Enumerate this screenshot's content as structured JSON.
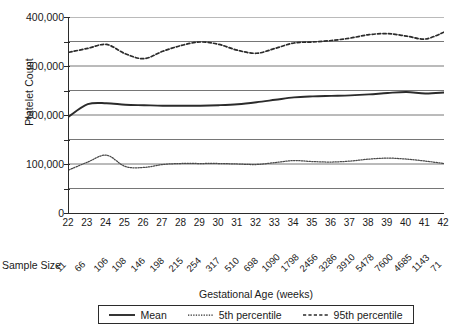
{
  "chart_data": {
    "type": "line",
    "title": "",
    "xlabel": "Gestational Age (weeks)",
    "ylabel": "Platelet Count",
    "xlim": [
      22,
      42
    ],
    "ylim": [
      0,
      400000
    ],
    "grid": true,
    "grid_interval": 50000,
    "legend_position": "bottom",
    "x": [
      22,
      23,
      24,
      25,
      26,
      27,
      28,
      29,
      30,
      31,
      32,
      33,
      34,
      35,
      36,
      37,
      38,
      39,
      40,
      41,
      42
    ],
    "xtick_labels": [
      "22",
      "23",
      "24",
      "25",
      "26",
      "27",
      "28",
      "29",
      "30",
      "31",
      "32",
      "33",
      "34",
      "35",
      "36",
      "37",
      "38",
      "39",
      "40",
      "41",
      "42"
    ],
    "ytick_labels": [
      "400,000",
      "300,000",
      "200,000",
      "100,000",
      "0"
    ],
    "ytick_values": [
      400000,
      300000,
      200000,
      100000,
      0
    ],
    "series": [
      {
        "name": "Mean",
        "style": "solid",
        "color": "#2b2b2b",
        "values": [
          197000,
          222000,
          224000,
          221000,
          220000,
          219000,
          219000,
          219000,
          220000,
          222000,
          226000,
          231000,
          236000,
          238000,
          239000,
          240000,
          242000,
          245000,
          247000,
          244000,
          246000
        ]
      },
      {
        "name": "5th percentile",
        "style": "dotted",
        "color": "#4a4a4a",
        "values": [
          88000,
          104000,
          118000,
          95000,
          93000,
          99000,
          101000,
          101000,
          101000,
          100000,
          99000,
          103000,
          107000,
          105000,
          104000,
          106000,
          110000,
          112000,
          110000,
          106000,
          101000
        ]
      },
      {
        "name": "95th percentile",
        "style": "dashed",
        "color": "#2b2b2b",
        "values": [
          328000,
          336000,
          344000,
          325000,
          315000,
          330000,
          342000,
          349000,
          344000,
          332000,
          326000,
          336000,
          347000,
          349000,
          352000,
          357000,
          364000,
          366000,
          361000,
          355000,
          369000
        ]
      }
    ]
  },
  "sample_size": {
    "label": "Sample Size",
    "values": [
      "11",
      "66",
      "106",
      "108",
      "146",
      "198",
      "215",
      "254",
      "317",
      "510",
      "698",
      "1090",
      "1798",
      "2456",
      "3286",
      "3910",
      "5478",
      "7600",
      "4685",
      "1143",
      "71"
    ]
  },
  "legend": {
    "items": [
      {
        "label": "Mean",
        "style": "solid"
      },
      {
        "label": "5th percentile",
        "style": "dotted"
      },
      {
        "label": "95th percentile",
        "style": "dashed"
      }
    ]
  }
}
